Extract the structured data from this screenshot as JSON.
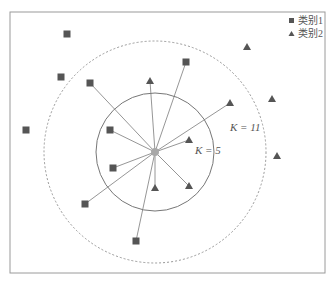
{
  "diagram": {
    "type": "knn-illustration",
    "frame": {
      "x": 10,
      "y": 12,
      "width": 315,
      "height": 261,
      "stroke": "#9a9a9a"
    },
    "query_point": {
      "x": 155,
      "y": 152,
      "color": "#a8a8a8"
    },
    "circles": [
      {
        "name": "k5-circle",
        "cx": 155,
        "cy": 152,
        "r": 59,
        "style": "solid",
        "label": "K = 5",
        "label_x": 195,
        "label_y": 154
      },
      {
        "name": "k11-circle",
        "cx": 155,
        "cy": 152,
        "r": 111,
        "style": "dashed",
        "label": "K = 11",
        "label_x": 230,
        "label_y": 131
      }
    ],
    "class1_points": [
      {
        "x": 67,
        "y": 34
      },
      {
        "x": 61,
        "y": 77
      },
      {
        "x": 90,
        "y": 83
      },
      {
        "x": 26,
        "y": 130
      },
      {
        "x": 186,
        "y": 62
      },
      {
        "x": 110,
        "y": 130
      },
      {
        "x": 113,
        "y": 168
      },
      {
        "x": 85,
        "y": 204
      },
      {
        "x": 136,
        "y": 241
      }
    ],
    "class2_points": [
      {
        "x": 150,
        "y": 81
      },
      {
        "x": 247,
        "y": 47
      },
      {
        "x": 230,
        "y": 103
      },
      {
        "x": 272,
        "y": 99
      },
      {
        "x": 189,
        "y": 140
      },
      {
        "x": 277,
        "y": 156
      },
      {
        "x": 189,
        "y": 186
      },
      {
        "x": 155,
        "y": 188
      }
    ],
    "neighbor_links": [
      {
        "x": 90,
        "y": 83
      },
      {
        "x": 150,
        "y": 81
      },
      {
        "x": 186,
        "y": 62
      },
      {
        "x": 230,
        "y": 103
      },
      {
        "x": 110,
        "y": 130
      },
      {
        "x": 189,
        "y": 140
      },
      {
        "x": 113,
        "y": 168
      },
      {
        "x": 85,
        "y": 204
      },
      {
        "x": 155,
        "y": 188
      },
      {
        "x": 189,
        "y": 186
      },
      {
        "x": 136,
        "y": 241
      }
    ],
    "colors": {
      "marker": "#555555",
      "line": "#8a8a8a",
      "circle": "#777777",
      "dashed_circle": "#999999"
    }
  },
  "legend": {
    "items": [
      {
        "marker": "square",
        "label": "类别1"
      },
      {
        "marker": "triangle",
        "label": "类别2"
      }
    ]
  },
  "labels": {
    "k5": "K = 5",
    "k11": "K = 11"
  }
}
